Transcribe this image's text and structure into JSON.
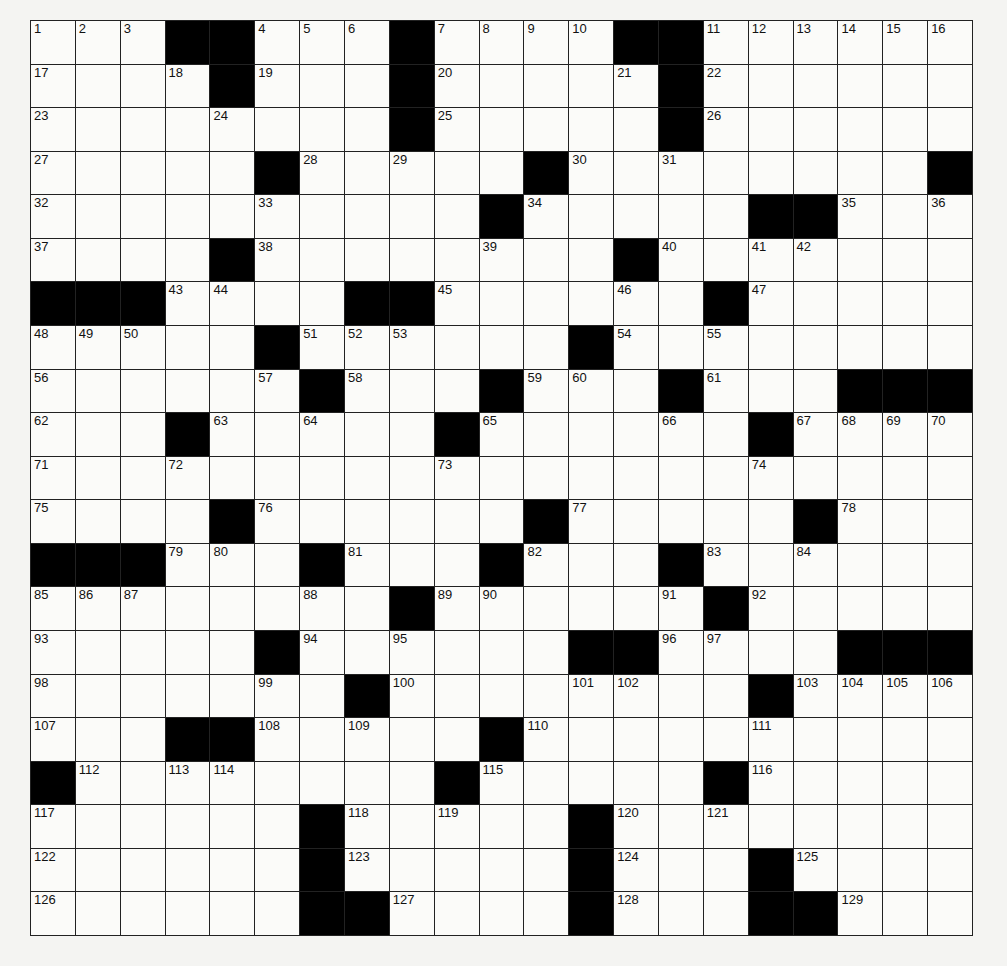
{
  "puzzle": {
    "rows": 21,
    "cols": 21,
    "grid": [
      [
        "1",
        "2",
        "3",
        "#",
        "#",
        "4",
        "5",
        "6",
        "#",
        "7",
        "8",
        "9",
        "10",
        "#",
        "#",
        "11",
        "12",
        "13",
        "14",
        "15",
        "16"
      ],
      [
        "17",
        "",
        "",
        "18",
        "#",
        "19",
        "",
        "",
        "#",
        "20",
        "",
        "",
        "",
        "21",
        "#",
        "22",
        "",
        "",
        "",
        "",
        ""
      ],
      [
        "23",
        "",
        "",
        "",
        "24",
        "",
        "",
        "",
        "#",
        "25",
        "",
        "",
        "",
        "",
        "#",
        "26",
        "",
        "",
        "",
        "",
        ""
      ],
      [
        "27",
        "",
        "",
        "",
        "",
        "#",
        "28",
        "",
        "29",
        "",
        "",
        "#",
        "30",
        "",
        "31",
        "",
        "",
        "",
        "",
        "",
        "#"
      ],
      [
        "32",
        "",
        "",
        "",
        "",
        "33",
        "",
        "",
        "",
        "",
        "#",
        "34",
        "",
        "",
        "",
        "",
        "#",
        "#",
        "35",
        "",
        "36"
      ],
      [
        "37",
        "",
        "",
        "",
        "#",
        "38",
        "",
        "",
        "",
        "",
        "39",
        "",
        "",
        "#",
        "40",
        "",
        "41",
        "42",
        "",
        "",
        ""
      ],
      [
        "#",
        "#",
        "#",
        "43",
        "44",
        "",
        "",
        "#",
        "#",
        "45",
        "",
        "",
        "",
        "46",
        "",
        "#",
        "47",
        "",
        "",
        "",
        ""
      ],
      [
        "48",
        "49",
        "50",
        "",
        "",
        "#",
        "51",
        "52",
        "53",
        "",
        "",
        "",
        "#",
        "54",
        "",
        "55",
        "",
        "",
        "",
        "",
        ""
      ],
      [
        "56",
        "",
        "",
        "",
        "",
        "57",
        "#",
        "58",
        "",
        "",
        "#",
        "59",
        "60",
        "",
        "#",
        "61",
        "",
        "",
        "#",
        "#",
        "#"
      ],
      [
        "62",
        "",
        "",
        "#",
        "63",
        "",
        "64",
        "",
        "",
        "#",
        "65",
        "",
        "",
        "",
        "66",
        "",
        "#",
        "67",
        "68",
        "69",
        "70"
      ],
      [
        "71",
        "",
        "",
        "72",
        "",
        "",
        "",
        "",
        "",
        "73",
        "",
        "",
        "",
        "",
        "",
        "",
        "74",
        "",
        "",
        "",
        ""
      ],
      [
        "75",
        "",
        "",
        "",
        "#",
        "76",
        "",
        "",
        "",
        "",
        "",
        "#",
        "77",
        "",
        "",
        "",
        "",
        "#",
        "78",
        "",
        ""
      ],
      [
        "#",
        "#",
        "#",
        "79",
        "80",
        "",
        "#",
        "81",
        "",
        "",
        "#",
        "82",
        "",
        "",
        "#",
        "83",
        "",
        "84",
        "",
        "",
        ""
      ],
      [
        "85",
        "86",
        "87",
        "",
        "",
        "",
        "88",
        "",
        "#",
        "89",
        "90",
        "",
        "",
        "",
        "91",
        "#",
        "92",
        "",
        "",
        "",
        ""
      ],
      [
        "93",
        "",
        "",
        "",
        "",
        "#",
        "94",
        "",
        "95",
        "",
        "",
        "",
        "#",
        "#",
        "96",
        "97",
        "",
        "",
        "#",
        "#",
        "#"
      ],
      [
        "98",
        "",
        "",
        "",
        "",
        "99",
        "",
        "#",
        "100",
        "",
        "",
        "",
        "101",
        "102",
        "",
        "",
        "#",
        "103",
        "104",
        "105",
        "106"
      ],
      [
        "107",
        "",
        "",
        "#",
        "#",
        "108",
        "",
        "109",
        "",
        "",
        "#",
        "110",
        "",
        "",
        "",
        "",
        "111",
        "",
        "",
        "",
        ""
      ],
      [
        "#",
        "112",
        "",
        "113",
        "114",
        "",
        "",
        "",
        "",
        "#",
        "115",
        "",
        "",
        "",
        "",
        "#",
        "116",
        "",
        "",
        "",
        ""
      ],
      [
        "117",
        "",
        "",
        "",
        "",
        "",
        "#",
        "118",
        "",
        "119",
        "",
        "",
        "#",
        "120",
        "",
        "121",
        "",
        "",
        "",
        "",
        ""
      ],
      [
        "122",
        "",
        "",
        "",
        "",
        "",
        "#",
        "123",
        "",
        "",
        "",
        "",
        "#",
        "124",
        "",
        "",
        "#",
        "125",
        "",
        "",
        ""
      ],
      [
        "126",
        "",
        "",
        "",
        "",
        "",
        "#",
        "#",
        "127",
        "",
        "",
        "",
        "#",
        "128",
        "",
        "",
        "#",
        "#",
        "129",
        "",
        ""
      ]
    ]
  }
}
